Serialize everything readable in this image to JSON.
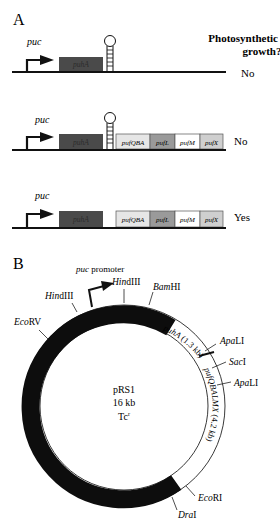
{
  "panel_a": {
    "label": "A",
    "column_header_line1": "Photosynthetic",
    "column_header_line2": "growth?",
    "constructs": [
      {
        "promoter": "puc",
        "genes": [
          "puhA"
        ],
        "terminator": true,
        "downstream_genes": [],
        "growth": "No"
      },
      {
        "promoter": "puc",
        "genes": [
          "puhA"
        ],
        "terminator": true,
        "downstream_genes": [
          "pufQBA",
          "pufL",
          "pufM",
          "pufX"
        ],
        "growth": "No"
      },
      {
        "promoter": "puc",
        "genes": [
          "puhA"
        ],
        "terminator": false,
        "downstream_genes": [
          "pufQBA",
          "pufL",
          "pufM",
          "pufX"
        ],
        "growth": "Yes"
      }
    ]
  },
  "panel_b": {
    "label": "B",
    "plasmid": {
      "name": "pRS1",
      "size": "16 kb",
      "marker_base": "Tc",
      "marker_sup": "r"
    },
    "promoter_label_italic": "puc",
    "promoter_label_rest": " promoter",
    "segments": {
      "puhA": {
        "italic": "puhA",
        "rest": " (1.3 kb)"
      },
      "puf": {
        "italic": "pufQBALMX",
        "rest": " (4.2 kb)"
      }
    },
    "sites": [
      {
        "it": "Hin",
        "rm": "dIII",
        "pos": "left-top"
      },
      {
        "it": "Hin",
        "rm": "dIII",
        "pos": "top"
      },
      {
        "it": "Bam",
        "rm": "HI",
        "pos": "top-right"
      },
      {
        "it": "Eco",
        "rm": "RV",
        "pos": "left"
      },
      {
        "it": "Apa",
        "rm": "LI",
        "pos": "right-upper"
      },
      {
        "it": "Sac",
        "rm": "I",
        "pos": "right"
      },
      {
        "it": "Apa",
        "rm": "LI",
        "pos": "right-lower"
      },
      {
        "it": "Eco",
        "rm": "RI",
        "pos": "bottom-right"
      },
      {
        "it": "Dra",
        "rm": "I",
        "pos": "bottom"
      }
    ]
  },
  "colors": {
    "puhA": "#4a4a4a",
    "pufQBA": "#e6e6e6",
    "pufL": "#9a9a9a",
    "pufM": "#ffffff",
    "pufX": "#cfcfcf",
    "line": "#111111",
    "ring_black": "#0d0d0d"
  }
}
